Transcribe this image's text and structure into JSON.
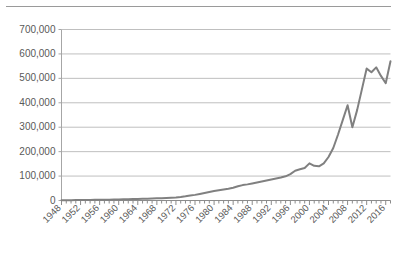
{
  "figure": {
    "background_color": "#ffffff",
    "top_rule_color": "#9a9a9a",
    "axis_color": "#a6a6a6",
    "gridline_color": "#bfbfbf",
    "tick_label_color": "#595959",
    "series_color": "#808080"
  },
  "chart_data": {
    "type": "line",
    "title": "",
    "subtitle": "",
    "xlabel": "",
    "ylabel": "",
    "legend": [],
    "legend_position": "none",
    "grid": "horizontal",
    "xlim": [
      1948,
      2017
    ],
    "ylim": [
      0,
      700000
    ],
    "ytick_labels": [
      "0",
      "100,000",
      "200,000",
      "300,000",
      "400,000",
      "500,000",
      "600,000",
      "700,000"
    ],
    "ytick_values": [
      0,
      100000,
      200000,
      300000,
      400000,
      500000,
      600000,
      700000
    ],
    "xtick_labels": [
      "1948",
      "1952",
      "1956",
      "1960",
      "1964",
      "1968",
      "1972",
      "1976",
      "1980",
      "1984",
      "1988",
      "1992",
      "1996",
      "2000",
      "2004",
      "2008",
      "2012",
      "2016"
    ],
    "xtick_values": [
      1948,
      1952,
      1956,
      1960,
      1964,
      1968,
      1972,
      1976,
      1980,
      1984,
      1988,
      1992,
      1996,
      2000,
      2004,
      2008,
      2012,
      2016
    ],
    "xtick_rotation": 45,
    "minor_xticks_every": 1,
    "x": [
      1948,
      1949,
      1950,
      1951,
      1952,
      1953,
      1954,
      1955,
      1956,
      1957,
      1958,
      1959,
      1960,
      1961,
      1962,
      1963,
      1964,
      1965,
      1966,
      1967,
      1968,
      1969,
      1970,
      1971,
      1972,
      1973,
      1974,
      1975,
      1976,
      1977,
      1978,
      1979,
      1980,
      1981,
      1982,
      1983,
      1984,
      1985,
      1986,
      1987,
      1988,
      1989,
      1990,
      1991,
      1992,
      1993,
      1994,
      1995,
      1996,
      1997,
      1998,
      1999,
      2000,
      2001,
      2002,
      2003,
      2004,
      2005,
      2006,
      2007,
      2008,
      2009,
      2010,
      2011,
      2012,
      2013,
      2014,
      2015,
      2016,
      2017
    ],
    "values": [
      1000,
      1200,
      1400,
      1600,
      1800,
      2000,
      2300,
      2600,
      2900,
      3200,
      3500,
      3900,
      4300,
      4700,
      5200,
      5700,
      6200,
      6800,
      7400,
      8100,
      8800,
      9600,
      10500,
      11500,
      12700,
      14500,
      17000,
      20000,
      23000,
      27000,
      31000,
      35000,
      39000,
      42000,
      45000,
      48000,
      52000,
      58000,
      63000,
      66000,
      70000,
      74000,
      78000,
      82000,
      86000,
      90000,
      94000,
      99000,
      108000,
      122000,
      128000,
      133000,
      152000,
      142000,
      140000,
      152000,
      178000,
      215000,
      270000,
      330000,
      390000,
      300000,
      370000,
      455000,
      540000,
      525000,
      545000,
      510000,
      480000,
      570000
    ],
    "series": [
      {
        "name": "",
        "color": "#808080",
        "line_width": 2,
        "markers": false
      }
    ]
  }
}
